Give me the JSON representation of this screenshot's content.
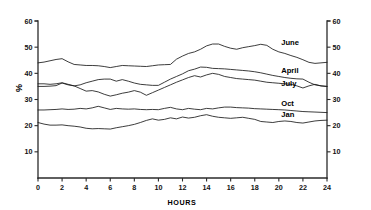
{
  "chart_data": {
    "type": "line",
    "title": "",
    "subtitle": "",
    "xlabel": "HOURS",
    "ylabel": "%",
    "xlim": [
      0,
      24
    ],
    "ylim": [
      0,
      60
    ],
    "grid": false,
    "legend_position": "inline-right-of-curve",
    "x_ticks": [
      0,
      2,
      4,
      6,
      8,
      10,
      12,
      14,
      16,
      18,
      20,
      22,
      24
    ],
    "y_ticks": [
      10,
      20,
      30,
      40,
      50,
      60
    ],
    "right_axis": true,
    "right_axis_ticks": [
      10,
      20,
      30,
      40,
      50,
      60
    ],
    "x": [
      0,
      0.5,
      1,
      1.5,
      2,
      2.5,
      3,
      3.5,
      4,
      4.5,
      5,
      5.5,
      6,
      6.5,
      7,
      7.5,
      8,
      8.5,
      9,
      9.5,
      10,
      10.5,
      11,
      11.5,
      12,
      12.5,
      13,
      13.5,
      14,
      14.5,
      15,
      15.5,
      16,
      16.5,
      17,
      17.5,
      18,
      18.5,
      19,
      19.5,
      20,
      20.5,
      21,
      21.5,
      22,
      22.5,
      23,
      23.5,
      24
    ],
    "series": [
      {
        "name": "June",
        "label": "June",
        "values": [
          44.0,
          44.3,
          44.8,
          45.3,
          45.6,
          44.4,
          43.4,
          43.2,
          43.0,
          43.0,
          42.9,
          42.6,
          42.2,
          42.6,
          43.0,
          42.9,
          42.8,
          42.7,
          42.6,
          42.9,
          43.2,
          43.3,
          43.4,
          45.4,
          46.6,
          47.6,
          48.2,
          49.2,
          50.5,
          51.2,
          51.2,
          50.3,
          49.6,
          49.2,
          49.8,
          50.2,
          50.6,
          51.1,
          50.7,
          49.2,
          48.2,
          47.6,
          46.8,
          46.1,
          45.2,
          44.2,
          43.8,
          44.0,
          44.2
        ]
      },
      {
        "name": "April",
        "label": "April",
        "values": [
          35.0,
          35.0,
          35.1,
          35.3,
          36.3,
          35.6,
          35.2,
          35.6,
          36.4,
          37.0,
          37.6,
          37.8,
          37.8,
          37.0,
          37.6,
          37.0,
          36.3,
          35.8,
          35.6,
          35.4,
          35.4,
          36.6,
          37.8,
          38.8,
          39.8,
          41.0,
          41.6,
          42.4,
          42.3,
          41.9,
          41.8,
          41.7,
          41.5,
          41.3,
          41.1,
          40.9,
          40.6,
          40.2,
          39.7,
          39.2,
          38.8,
          38.4,
          38.1,
          37.9,
          37.8,
          36.6,
          35.6,
          35.2,
          35.0
        ]
      },
      {
        "name": "July",
        "label": "July",
        "values": [
          36.0,
          36.0,
          35.8,
          36.0,
          36.4,
          35.8,
          35.2,
          34.2,
          33.2,
          33.4,
          32.9,
          32.0,
          31.3,
          31.8,
          32.4,
          32.8,
          33.4,
          32.8,
          31.6,
          32.6,
          33.6,
          34.6,
          35.6,
          36.6,
          37.5,
          38.4,
          39.1,
          38.6,
          39.4,
          40.0,
          39.6,
          38.8,
          38.4,
          38.0,
          37.8,
          37.6,
          37.4,
          37.0,
          36.6,
          36.4,
          36.2,
          36.0,
          35.8,
          35.2,
          34.4,
          35.2,
          35.8,
          35.2,
          35.0
        ]
      },
      {
        "name": "Oct",
        "label": "Oct",
        "values": [
          26.0,
          26.0,
          26.1,
          26.2,
          26.4,
          26.2,
          26.3,
          26.6,
          26.4,
          26.8,
          27.4,
          26.8,
          26.2,
          26.6,
          26.4,
          26.3,
          26.4,
          26.2,
          26.1,
          26.2,
          26.1,
          26.6,
          27.0,
          26.4,
          26.1,
          26.6,
          26.3,
          26.1,
          26.6,
          26.4,
          26.8,
          27.1,
          27.1,
          26.9,
          26.8,
          26.7,
          26.5,
          26.4,
          26.3,
          26.2,
          26.1,
          26.0,
          25.8,
          25.6,
          25.4,
          25.3,
          25.2,
          25.1,
          25.0
        ]
      },
      {
        "name": "Jan",
        "label": "Jan",
        "values": [
          21.2,
          20.6,
          20.2,
          20.2,
          20.3,
          20.0,
          19.8,
          19.5,
          19.0,
          18.8,
          18.9,
          18.8,
          18.7,
          19.2,
          19.6,
          20.0,
          20.5,
          21.2,
          22.0,
          22.6,
          22.1,
          22.4,
          23.0,
          22.6,
          23.3,
          22.9,
          23.2,
          23.8,
          24.2,
          23.6,
          23.2,
          23.0,
          22.8,
          23.0,
          23.2,
          22.8,
          22.4,
          21.6,
          21.4,
          21.2,
          21.6,
          21.8,
          21.6,
          21.2,
          21.0,
          21.4,
          21.8,
          22.0,
          22.1
        ]
      }
    ],
    "annotations": [
      {
        "text": "June",
        "series": "June",
        "x": 20.2,
        "y": 50.8
      },
      {
        "text": "April",
        "series": "April",
        "x": 20.2,
        "y": 40.2
      },
      {
        "text": "July",
        "series": "July",
        "x": 20.2,
        "y": 35.2
      },
      {
        "text": "Oct",
        "series": "Oct",
        "x": 20.2,
        "y": 27.6
      },
      {
        "text": "Jan",
        "series": "Jan",
        "x": 20.2,
        "y": 23.4
      }
    ]
  },
  "axes": {
    "x_title": "HOURS",
    "y_title": "%",
    "x_tick_labels": [
      "0",
      "2",
      "4",
      "6",
      "8",
      "10",
      "12",
      "14",
      "16",
      "18",
      "20",
      "22",
      "24"
    ],
    "y_tick_labels": [
      "10",
      "20",
      "30",
      "40",
      "50",
      "60"
    ],
    "y_tick_labels_right": [
      "10",
      "20",
      "30",
      "40",
      "50",
      "60"
    ]
  },
  "labels": {
    "june": "June",
    "april": "April",
    "july": "July",
    "oct": "Oct",
    "jan": "Jan"
  },
  "colors": {
    "background": "#ffffff",
    "line": "#1a1a1a",
    "axis": "#2a2a2a",
    "text": "#000000"
  }
}
